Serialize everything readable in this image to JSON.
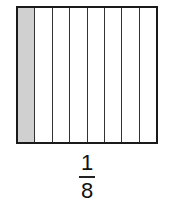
{
  "diagram": {
    "type": "fraction-model",
    "total_parts": 8,
    "shaded_parts": 1,
    "shaded_color": "#d0d0d0",
    "cells": [
      {
        "shaded": true
      },
      {
        "shaded": false
      },
      {
        "shaded": false
      },
      {
        "shaded": false
      },
      {
        "shaded": false
      },
      {
        "shaded": false
      },
      {
        "shaded": false
      },
      {
        "shaded": false
      }
    ],
    "fraction": {
      "numerator": "1",
      "denominator": "8"
    }
  }
}
